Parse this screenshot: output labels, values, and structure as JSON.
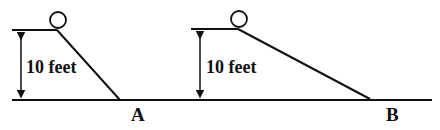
{
  "diagram": {
    "ramp_a": {
      "height_label": "10 feet",
      "end_label": "A"
    },
    "ramp_b": {
      "height_label": "10 feet",
      "end_label": "B"
    },
    "colors": {
      "stroke": "#111111",
      "background": "#ffffff"
    }
  }
}
